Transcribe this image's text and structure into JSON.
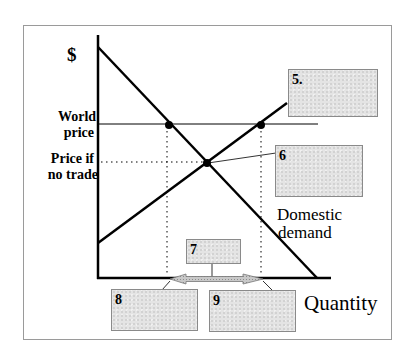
{
  "diagram": {
    "type": "supply-demand-world-price",
    "y_axis_label": "$",
    "x_axis_label": "Quantity",
    "price_labels": {
      "world_price_line1": "World",
      "world_price_line2": "price",
      "no_trade_line1": "Price if",
      "no_trade_line2": "no trade"
    },
    "curve_labels": {
      "demand_line1": "Domestic",
      "demand_line2": "demand"
    },
    "answer_boxes": [
      {
        "id": "5",
        "label": "5."
      },
      {
        "id": "6",
        "label": "6"
      },
      {
        "id": "7",
        "label": "7"
      },
      {
        "id": "8",
        "label": "8"
      },
      {
        "id": "9",
        "label": "9"
      }
    ],
    "colors": {
      "line": "#000000",
      "frame": "#9a9a9a",
      "box_fill": "#e4e4e4",
      "box_border": "#8a8a8a",
      "arrow_fill": "#b8b8b8"
    }
  }
}
